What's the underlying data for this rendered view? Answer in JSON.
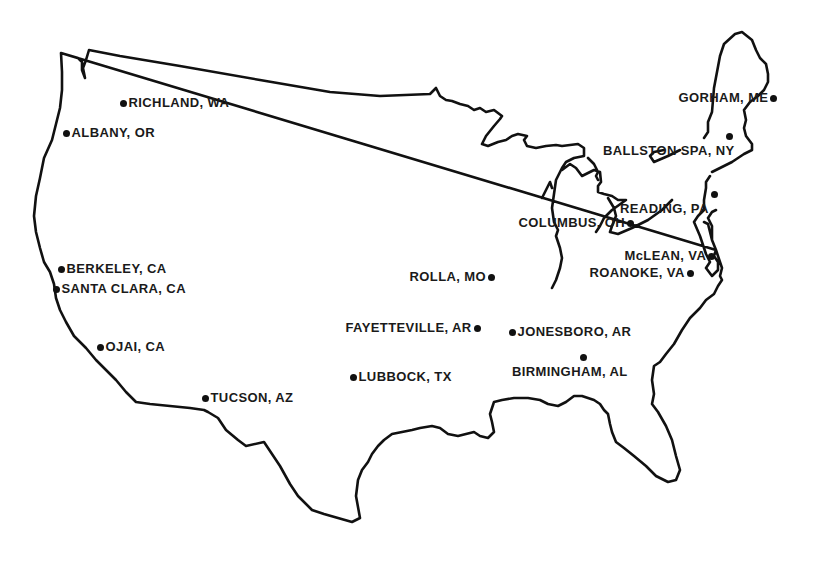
{
  "map": {
    "region": "Contiguous United States",
    "outline_color": "#111111",
    "background": "#ffffff",
    "locations": [
      {
        "label": "RICHLAND, WA",
        "dot_x": 123,
        "dot_y": 103
      },
      {
        "label": "ALBANY, OR",
        "dot_x": 66,
        "dot_y": 133
      },
      {
        "label": "GORHAM, ME",
        "dot_x": 774,
        "dot_y": 98
      },
      {
        "label": "BALLSTON SPA, NY",
        "dot_x": 729,
        "dot_y": 136
      },
      {
        "label": "READING, PA",
        "dot_x": 714,
        "dot_y": 194
      },
      {
        "label": "COLUMBUS, OH",
        "dot_x": 631,
        "dot_y": 223
      },
      {
        "label": "McLEAN, VA",
        "dot_x": 712,
        "dot_y": 256
      },
      {
        "label": "ROANOKE, VA",
        "dot_x": 690,
        "dot_y": 273
      },
      {
        "label": "ROLLA, MO",
        "dot_x": 492,
        "dot_y": 277
      },
      {
        "label": "BERKELEY, CA",
        "dot_x": 61,
        "dot_y": 269
      },
      {
        "label": "SANTA CLARA, CA",
        "dot_x": 56,
        "dot_y": 289
      },
      {
        "label": "FAYETTEVILLE, AR",
        "dot_x": 477,
        "dot_y": 328
      },
      {
        "label": "JONESBORO, AR",
        "dot_x": 512,
        "dot_y": 332
      },
      {
        "label": "BIRMINGHAM, AL",
        "dot_x": 583,
        "dot_y": 357
      },
      {
        "label": "OJAI, CA",
        "dot_x": 100,
        "dot_y": 347
      },
      {
        "label": "LUBBOCK, TX",
        "dot_x": 353,
        "dot_y": 377
      },
      {
        "label": "TUCSON, AZ",
        "dot_x": 205,
        "dot_y": 398
      }
    ]
  }
}
